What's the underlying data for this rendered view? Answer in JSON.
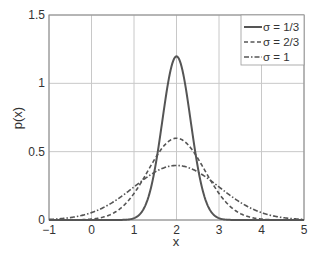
{
  "chart_data": {
    "type": "line",
    "title": "",
    "xlabel": "x",
    "ylabel": "p(x)",
    "xlim": [
      -1,
      5
    ],
    "ylim": [
      0,
      1.5
    ],
    "xticks": [
      "-1",
      "0",
      "1",
      "2",
      "3",
      "4",
      "5"
    ],
    "yticks": [
      "0",
      "0.5",
      "1",
      "1.5"
    ],
    "grid": true,
    "legend_position": "upper right",
    "series": [
      {
        "name": "σ = 1/3",
        "mean": 2,
        "sigma": 0.3333,
        "style": "solid",
        "peak": 1.2
      },
      {
        "name": "σ = 2/3",
        "mean": 2,
        "sigma": 0.6667,
        "style": "dashed",
        "peak": 0.6
      },
      {
        "name": "σ = 1",
        "mean": 2,
        "sigma": 1.0,
        "style": "dash-dot",
        "peak": 0.4
      }
    ]
  },
  "colors": {
    "line": "#555555",
    "grid": "#c8c8c8",
    "axis": "#666666"
  }
}
